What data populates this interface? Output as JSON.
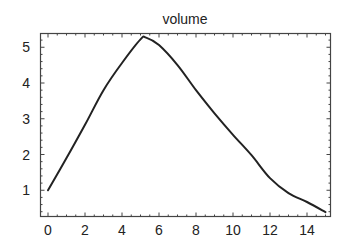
{
  "chart_data": {
    "type": "line",
    "title": "volume",
    "xlabel": "",
    "ylabel": "",
    "xlim": [
      -0.4,
      15.25
    ],
    "ylim": [
      0.28,
      5.39
    ],
    "grid": false,
    "legend": null,
    "frame": "box with ticks on all four sides",
    "x_ticks": [
      0,
      2,
      4,
      6,
      8,
      10,
      12,
      14
    ],
    "x_tick_labels": [
      "0",
      "2",
      "4",
      "6",
      "8",
      "10",
      "12",
      "14"
    ],
    "y_ticks": [
      1,
      2,
      3,
      4,
      5
    ],
    "y_tick_labels": [
      "1",
      "2",
      "3",
      "4",
      "5"
    ],
    "series": [
      {
        "name": "volume",
        "color": "#222222",
        "x": [
          0,
          1,
          2,
          3,
          4,
          5,
          5.3,
          6,
          7,
          8,
          9,
          10,
          11,
          12,
          13,
          14,
          15
        ],
        "y": [
          1.0,
          1.9,
          2.83,
          3.8,
          4.56,
          5.22,
          5.27,
          5.06,
          4.5,
          3.8,
          3.15,
          2.55,
          1.98,
          1.34,
          0.92,
          0.67,
          0.39
        ]
      }
    ]
  },
  "colors": {
    "background": "#ffffff",
    "line": "#222222",
    "frame": "#444444",
    "text": "#222222"
  }
}
